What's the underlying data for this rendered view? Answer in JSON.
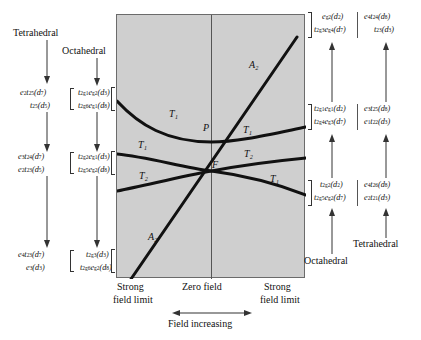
{
  "figure": {
    "type": "correlation-diagram",
    "title": "",
    "panel": {
      "fill_color": "#cfcfcf",
      "border_color": "#6b6b6b",
      "zero_field_line": true
    }
  },
  "headers": {
    "tetrahedral_top_left": "Tetrahedral",
    "octahedral_top_left": "Octahedral",
    "octahedral_bottom_right": "Octahedral",
    "tetrahedral_bottom_right": "Tetrahedral"
  },
  "axis": {
    "left_limit_line1": "Strong",
    "left_limit_line2": "field limit",
    "center": "Zero field",
    "right_limit_line1": "Strong",
    "right_limit_line2": "field limit",
    "field_direction": "Field increasing"
  },
  "curve_labels": {
    "top_left_T1": "T₁",
    "mid_left_T1": "T₁",
    "low_left_T2": "T₂",
    "bottom_left_A2": "A₂",
    "top_right_A2": "A₂",
    "upper_right_T1": "T₁",
    "mid_right_T2": "T₂",
    "low_right_T1": "T₁",
    "point_P": "P",
    "point_F": "F"
  },
  "left_labels": {
    "tetrahedral": [
      {
        "line1_html": "e<sup>2</sup>t<sub>2</sub><sup>5</sup>(d<sup>7</sup>)",
        "line2_html": "t<sub>2</sub><sup>5</sup>(d<sup>5</sup>)"
      },
      {
        "line1_html": "e<sup>3</sup>t<sub>2</sub><sup>4</sup>(d<sup>7</sup>)",
        "line2_html": "e<sup>2</sup>t<sub>2</sub><sup>3</sup>(d<sup>5</sup>)"
      },
      {
        "line1_html": "e<sup>4</sup>t<sub>2</sub><sup>3</sup>(d<sup>7</sup>)",
        "line2_html": "e<sup>3</sup>(d<sup>3</sup>)"
      }
    ],
    "octahedral": [
      {
        "line1_html": "t<sub>2g</sub><sup>1</sup>e<sub>g</sub><sup>2</sup>(d<sup>3</sup>)",
        "line2_html": "t<sub>2g</sub><sup>6</sup>e<sub>g</sub><sup>1</sup>(d<sup>8</sup>)"
      },
      {
        "line1_html": "t<sub>2g</sub><sup>2</sup>e<sub>g</sub><sup>1</sup>(d<sup>3</sup>)",
        "line2_html": "t<sub>2g</sub><sup>5</sup>e<sub>g</sub><sup>2</sup>(d<sup>8</sup>)"
      },
      {
        "line1_html": "t<sub>2g</sub><sup>3</sup>(d<sup>3</sup>)",
        "line2_html": "t<sub>2g</sub><sup>6</sup>e<sub>g</sub><sup>2</sup>(d<sup>8</sup>)"
      }
    ]
  },
  "right_labels": {
    "octahedral": [
      {
        "line1_html": "e<sub>g</sub><sup>2</sup>(d<sup>2</sup>)",
        "line2_html": "t<sub>2g</sub><sup>3</sup>e<sub>g</sub><sup>4</sup>(d<sup>7</sup>)"
      },
      {
        "line1_html": "t<sub>2g</sub><sup>1</sup>e<sub>g</sub><sup>1</sup>(d<sup>2</sup>)",
        "line2_html": "t<sub>2g</sub><sup>4</sup>e<sub>g</sub><sup>3</sup>(d<sup>7</sup>)"
      },
      {
        "line1_html": "t<sub>2g</sub><sup>2</sup>(d<sup>2</sup>)",
        "line2_html": "t<sub>2g</sub><sup>5</sup>e<sub>g</sub><sup>2</sup>(d<sup>7</sup>)"
      }
    ],
    "tetrahedral": [
      {
        "line1_html": "e<sup>4</sup>t<sub>2</sub><sup>4</sup>(d<sup>8</sup>)",
        "line2_html": "t<sub>2</sub><sup>3</sup>(d<sup>3</sup>)"
      },
      {
        "line1_html": "e<sup>3</sup>t<sub>2</sub><sup>5</sup>(d<sup>8</sup>)",
        "line2_html": "e<sup>1</sup>t<sub>2</sub><sup>2</sup>(d<sup>3</sup>)"
      },
      {
        "line1_html": "e<sup>4</sup>t<sub>2</sub><sup>6</sup>(d<sup>8</sup>)",
        "line2_html": "e<sup>2</sup>t<sub>2</sub><sup>1</sup>(d<sup>3</sup>)"
      }
    ]
  }
}
